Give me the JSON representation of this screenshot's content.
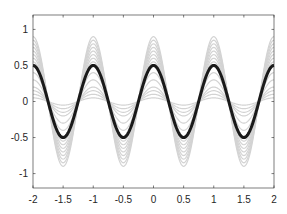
{
  "chart_data": {
    "type": "line",
    "title": "",
    "xlabel": "",
    "ylabel": "",
    "xlim": [
      -2,
      2
    ],
    "ylim": [
      -1.2,
      1.2
    ],
    "grid": false,
    "legend": null,
    "xticks": [
      -2,
      -1.5,
      -1,
      -0.5,
      0,
      0.5,
      1,
      1.5,
      2
    ],
    "xtick_labels": [
      "-2",
      "-1.5",
      "-1",
      "-0.5",
      "0",
      "0.5",
      "1",
      "1.5",
      "2"
    ],
    "yticks": [
      -1,
      -0.5,
      0,
      0.5,
      1
    ],
    "ytick_labels": [
      "-1",
      "-0.5",
      "0",
      "0.5",
      "1"
    ],
    "function": "y = A * cos(2*pi*x)",
    "series": [
      {
        "name": "gray-family",
        "color": "#d3d3d3",
        "width": 1.2,
        "amplitudes": [
          0.05,
          0.1,
          0.15,
          0.2,
          0.3,
          0.4,
          0.5,
          0.55,
          0.6,
          0.65,
          0.7,
          0.75,
          0.8,
          0.85,
          0.9
        ]
      },
      {
        "name": "highlight",
        "color": "#1a1a1a",
        "width": 3,
        "amplitudes": [
          0.5
        ]
      }
    ],
    "sample_points": {
      "x": [
        -2,
        -1.75,
        -1.5,
        -1.25,
        -1,
        -0.75,
        -0.5,
        -0.25,
        0,
        0.25,
        0.5,
        0.75,
        1,
        1.25,
        1.5,
        1.75,
        2
      ],
      "highlight_y": [
        0.5,
        0,
        -0.5,
        0,
        0.5,
        0,
        -0.5,
        0,
        0.5,
        0,
        -0.5,
        0,
        0.5,
        0,
        -0.5,
        0,
        0.5
      ]
    }
  },
  "colors": {
    "axes": "#262626",
    "background": "#ffffff"
  }
}
